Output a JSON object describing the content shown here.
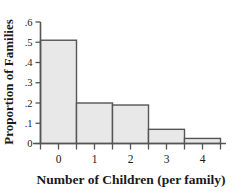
{
  "chart_data": {
    "type": "bar",
    "title": "",
    "subtitle": "",
    "xlabel": "Number of Children (per family)",
    "ylabel": "Proportion of Families",
    "categories": [
      "0",
      "1",
      "2",
      "3",
      "4"
    ],
    "values": [
      0.51,
      0.2,
      0.19,
      0.07,
      0.025
    ],
    "series": [
      {
        "name": "Proportion of Families",
        "values": [
          0.51,
          0.2,
          0.19,
          0.07,
          0.025
        ]
      }
    ],
    "ylim": [
      0,
      0.6
    ],
    "yticks": [
      0,
      0.1,
      0.2,
      0.3,
      0.4,
      0.5,
      0.6
    ],
    "ytick_labels": [
      "0",
      ".1",
      ".2",
      ".3",
      ".4",
      ".5",
      ".6"
    ],
    "xtick_labels": [
      "0",
      "1",
      "2",
      "3",
      "4"
    ],
    "grid": false,
    "legend": false,
    "legend_position": "none",
    "annotations": [],
    "bar_fill_color": "#e8e8e8",
    "bar_edge_color": "#555555",
    "axis_color": "#555555",
    "text_color": "#1a1a1a",
    "background_color": "#ffffff"
  },
  "axis_titles": {
    "x": "Number of Children (per family)",
    "y": "Proportion of Families"
  }
}
